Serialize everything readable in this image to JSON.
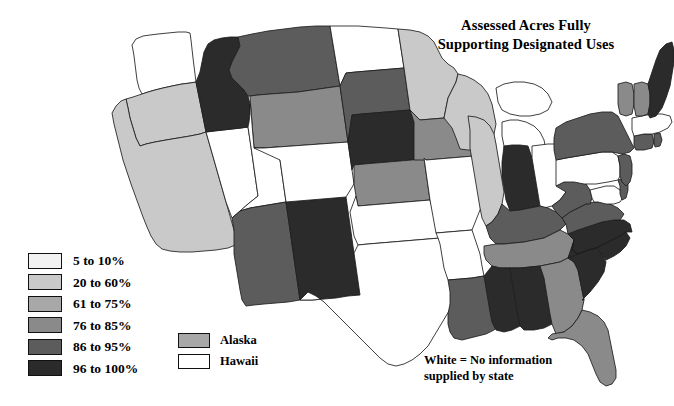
{
  "title": {
    "line1": "Assessed Acres Fully",
    "line2": "Supporting Designated Uses"
  },
  "footnote": {
    "line1": "White = No information",
    "line2": "supplied by state"
  },
  "legend": {
    "items": [
      {
        "label": "5 to 10%",
        "color": "#f2f2f2"
      },
      {
        "label": "20 to 60%",
        "color": "#c9c9c9"
      },
      {
        "label": "61 to 75%",
        "color": "#a8a8a8"
      },
      {
        "label": "76 to 85%",
        "color": "#8a8a8a"
      },
      {
        "label": "86 to 95%",
        "color": "#5c5c5c"
      },
      {
        "label": "96 to 100%",
        "color": "#2b2b2b"
      }
    ]
  },
  "inset_legend": {
    "items": [
      {
        "label": "Alaska",
        "color": "#a8a8a8"
      },
      {
        "label": "Hawaii",
        "color": "#ffffff"
      }
    ]
  },
  "chart_data": {
    "type": "map",
    "title": "Assessed Acres Fully Supporting Designated Uses",
    "subtitle": "",
    "units": "percent of assessed acres",
    "no_data_color": "#ffffff",
    "no_data_label": "White = No information supplied by state",
    "legend_position": "lower-left",
    "bins": [
      {
        "label": "5 to 10%",
        "min": 5,
        "max": 10,
        "color": "#f2f2f2"
      },
      {
        "label": "20 to 60%",
        "min": 20,
        "max": 60,
        "color": "#c9c9c9"
      },
      {
        "label": "61 to 75%",
        "min": 61,
        "max": 75,
        "color": "#a8a8a8"
      },
      {
        "label": "76 to 85%",
        "min": 76,
        "max": 85,
        "color": "#8a8a8a"
      },
      {
        "label": "86 to 95%",
        "min": 86,
        "max": 95,
        "color": "#5c5c5c"
      },
      {
        "label": "96 to 100%",
        "min": 96,
        "max": 100,
        "color": "#2b2b2b"
      }
    ],
    "states": {
      "WA": {
        "name": "Washington",
        "bin": null,
        "color": "#ffffff"
      },
      "OR": {
        "name": "Oregon",
        "bin": "20 to 60%",
        "color": "#c9c9c9"
      },
      "CA": {
        "name": "California",
        "bin": "20 to 60%",
        "color": "#c9c9c9"
      },
      "NV": {
        "name": "Nevada",
        "bin": null,
        "color": "#ffffff"
      },
      "ID": {
        "name": "Idaho",
        "bin": "96 to 100%",
        "color": "#2b2b2b"
      },
      "MT": {
        "name": "Montana",
        "bin": "86 to 95%",
        "color": "#5c5c5c"
      },
      "WY": {
        "name": "Wyoming",
        "bin": "76 to 85%",
        "color": "#8a8a8a"
      },
      "UT": {
        "name": "Utah",
        "bin": null,
        "color": "#ffffff"
      },
      "AZ": {
        "name": "Arizona",
        "bin": "86 to 95%",
        "color": "#5c5c5c"
      },
      "NM": {
        "name": "New Mexico",
        "bin": "96 to 100%",
        "color": "#2b2b2b"
      },
      "CO": {
        "name": "Colorado",
        "bin": null,
        "color": "#ffffff"
      },
      "ND": {
        "name": "North Dakota",
        "bin": null,
        "color": "#ffffff"
      },
      "SD": {
        "name": "South Dakota",
        "bin": "86 to 95%",
        "color": "#5c5c5c"
      },
      "NE": {
        "name": "Nebraska",
        "bin": "96 to 100%",
        "color": "#2b2b2b"
      },
      "KS": {
        "name": "Kansas",
        "bin": "76 to 85%",
        "color": "#8a8a8a"
      },
      "OK": {
        "name": "Oklahoma",
        "bin": null,
        "color": "#ffffff"
      },
      "TX": {
        "name": "Texas",
        "bin": null,
        "color": "#ffffff"
      },
      "MN": {
        "name": "Minnesota",
        "bin": "20 to 60%",
        "color": "#c9c9c9"
      },
      "IA": {
        "name": "Iowa",
        "bin": "76 to 85%",
        "color": "#8a8a8a"
      },
      "MO": {
        "name": "Missouri",
        "bin": null,
        "color": "#ffffff"
      },
      "AR": {
        "name": "Arkansas",
        "bin": null,
        "color": "#ffffff"
      },
      "LA": {
        "name": "Louisiana",
        "bin": "86 to 95%",
        "color": "#5c5c5c"
      },
      "WI": {
        "name": "Wisconsin",
        "bin": "20 to 60%",
        "color": "#c9c9c9"
      },
      "IL": {
        "name": "Illinois",
        "bin": "20 to 60%",
        "color": "#c9c9c9"
      },
      "MI": {
        "name": "Michigan",
        "bin": null,
        "color": "#ffffff"
      },
      "IN": {
        "name": "Indiana",
        "bin": "96 to 100%",
        "color": "#2b2b2b"
      },
      "OH": {
        "name": "Ohio",
        "bin": null,
        "color": "#ffffff"
      },
      "KY": {
        "name": "Kentucky",
        "bin": "86 to 95%",
        "color": "#5c5c5c"
      },
      "TN": {
        "name": "Tennessee",
        "bin": "76 to 85%",
        "color": "#8a8a8a"
      },
      "MS": {
        "name": "Mississippi",
        "bin": "96 to 100%",
        "color": "#2b2b2b"
      },
      "AL": {
        "name": "Alabama",
        "bin": "96 to 100%",
        "color": "#2b2b2b"
      },
      "GA": {
        "name": "Georgia",
        "bin": "76 to 85%",
        "color": "#8a8a8a"
      },
      "FL": {
        "name": "Florida",
        "bin": "76 to 85%",
        "color": "#8a8a8a"
      },
      "SC": {
        "name": "South Carolina",
        "bin": "96 to 100%",
        "color": "#2b2b2b"
      },
      "NC": {
        "name": "North Carolina",
        "bin": "96 to 100%",
        "color": "#2b2b2b"
      },
      "VA": {
        "name": "Virginia",
        "bin": "86 to 95%",
        "color": "#5c5c5c"
      },
      "WV": {
        "name": "West Virginia",
        "bin": "86 to 95%",
        "color": "#5c5c5c"
      },
      "MD": {
        "name": "Maryland",
        "bin": null,
        "color": "#ffffff"
      },
      "DE": {
        "name": "Delaware",
        "bin": "86 to 95%",
        "color": "#5c5c5c"
      },
      "PA": {
        "name": "Pennsylvania",
        "bin": null,
        "color": "#ffffff"
      },
      "NJ": {
        "name": "New Jersey",
        "bin": "86 to 95%",
        "color": "#5c5c5c"
      },
      "NY": {
        "name": "New York",
        "bin": "86 to 95%",
        "color": "#5c5c5c"
      },
      "CT": {
        "name": "Connecticut",
        "bin": "86 to 95%",
        "color": "#5c5c5c"
      },
      "RI": {
        "name": "Rhode Island",
        "bin": "86 to 95%",
        "color": "#5c5c5c"
      },
      "MA": {
        "name": "Massachusetts",
        "bin": null,
        "color": "#ffffff"
      },
      "VT": {
        "name": "Vermont",
        "bin": "76 to 85%",
        "color": "#8a8a8a"
      },
      "NH": {
        "name": "New Hampshire",
        "bin": "76 to 85%",
        "color": "#8a8a8a"
      },
      "ME": {
        "name": "Maine",
        "bin": "96 to 100%",
        "color": "#2b2b2b"
      },
      "AK": {
        "name": "Alaska",
        "bin": "61 to 75%",
        "color": "#a8a8a8"
      },
      "HI": {
        "name": "Hawaii",
        "bin": null,
        "color": "#ffffff"
      }
    }
  }
}
